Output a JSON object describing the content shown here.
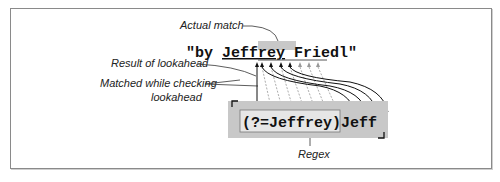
{
  "diagram": {
    "subject_text": "\"by Jeffrey Friedl\"",
    "subject_parts": {
      "prefix": "\"by ",
      "match": "Jeff",
      "lookahead_rest": "rey",
      "suffix": " Friedl\""
    },
    "regex": {
      "lookahead": "(?=Jeffrey)",
      "literal": "Jeff"
    },
    "labels": {
      "actual_match": "Actual match",
      "result_of_lookahead": "Result of lookahead",
      "matched_while_checking_line1": "Matched while checking",
      "matched_while_checking_line2": "lookahead",
      "regex": "Regex"
    },
    "colors": {
      "highlight": "#c8c8c8",
      "frame": "#8a8a8a",
      "text": "#111111"
    }
  }
}
